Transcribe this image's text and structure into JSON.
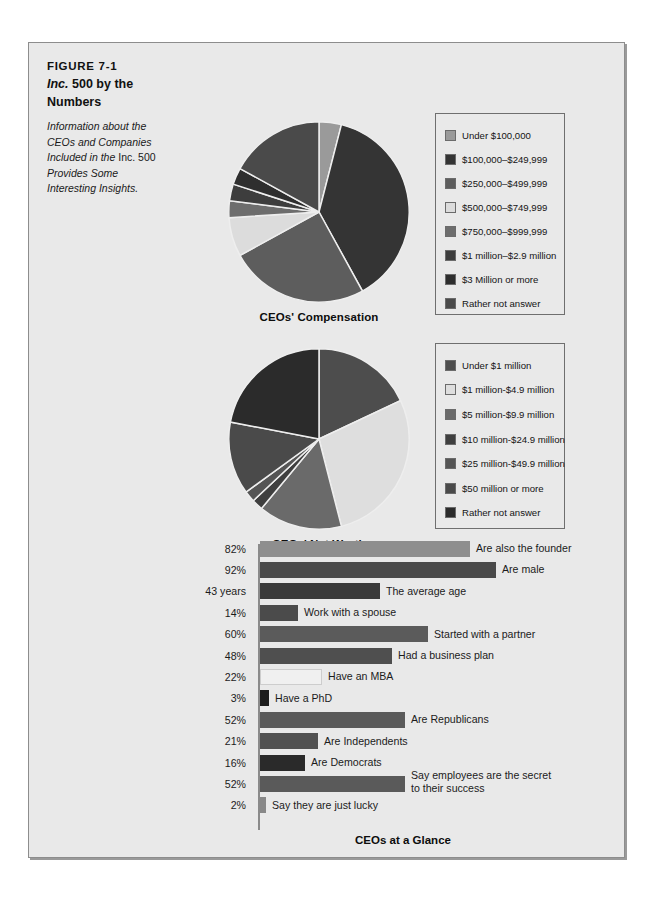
{
  "figure": {
    "number": "FIGURE 7-1",
    "title_italic": "Inc.",
    "title_rest": " 500 by the",
    "title_line2": "Numbers",
    "description_line1": "Information about the",
    "description_line2": "CEOs and Companies",
    "description_line3a": "Included in the ",
    "description_line3b": "Inc. 500",
    "description_line4": "Provides Some",
    "description_line5": "Interesting Insights."
  },
  "chart_data": [
    {
      "type": "pie",
      "title": "CEOs' Compensation",
      "legend_position": "right",
      "categories": [
        "Under $100,000",
        "$100,000–$249,999",
        "$250,000–$499,999",
        "$500,000–$749,999",
        "$750,000–$999,999",
        "$1 million–$2.9 million",
        "$3 Million or more",
        "Rather not answer"
      ],
      "values": [
        4,
        38,
        25,
        7,
        3,
        3,
        3,
        17
      ],
      "colors": [
        "#9a9a9a",
        "#343434",
        "#5d5d5d",
        "#dcdcdc",
        "#6d6d6d",
        "#3d3d3d",
        "#2e2e2e",
        "#4a4a4a"
      ]
    },
    {
      "type": "pie",
      "title": "CEOs' Net Worth",
      "legend_position": "right",
      "categories": [
        "Under $1 million",
        "$1 million-$4.9 million",
        "$5 million-$9.9 million",
        "$10 million-$24.9 million",
        "$25 million-$49.9 million",
        "$50 million or more",
        "Rather not answer"
      ],
      "values": [
        18,
        28,
        15,
        2,
        2,
        13,
        22
      ],
      "colors": [
        "#4d4d4d",
        "#dedede",
        "#6a6a6a",
        "#3f3f3f",
        "#555555",
        "#4a4a4a",
        "#2b2b2b"
      ]
    },
    {
      "type": "bar",
      "title": "CEOs at a Glance",
      "orientation": "horizontal",
      "xlabel": "",
      "ylabel": "",
      "categories": [
        "Are also the founder",
        "Are male",
        "The average age",
        "Work with a spouse",
        "Started with a partner",
        "Had a business plan",
        "Have an MBA",
        "Have a PhD",
        "Are Republicans",
        "Are Independents",
        "Are Democrats",
        "Say employees are the secret to their success",
        "Say they are just lucky"
      ],
      "value_labels": [
        "82%",
        "92%",
        "43 years",
        "14%",
        "60%",
        "48%",
        "22%",
        "3%",
        "52%",
        "21%",
        "16%",
        "52%",
        "2%"
      ],
      "values": [
        82,
        92,
        43,
        14,
        60,
        48,
        22,
        3,
        52,
        21,
        16,
        52,
        2
      ],
      "bar_colors": [
        "#8e8e8e",
        "#4a4a4a",
        "#3a3a3a",
        "#4b4b4b",
        "#5b5b5b",
        "#4f4f4f",
        "#f0f0f0",
        "#1d1d1d",
        "#5a5a5a",
        "#515151",
        "#2a2a2a",
        "#5a5a5a",
        "#888888"
      ],
      "bars": [
        {
          "value_label": "82%",
          "value": 82,
          "label": "Are also the founder",
          "label2": "",
          "color": "#8e8e8e",
          "width": 210
        },
        {
          "value_label": "92%",
          "value": 92,
          "label": "Are male",
          "label2": "",
          "color": "#4a4a4a",
          "width": 236
        },
        {
          "value_label": "43 years",
          "value": 43,
          "label": "The average age",
          "label2": "",
          "color": "#3a3a3a",
          "width": 120
        },
        {
          "value_label": "14%",
          "value": 14,
          "label": "Work with a spouse",
          "label2": "",
          "color": "#4b4b4b",
          "width": 38
        },
        {
          "value_label": "60%",
          "value": 60,
          "label": "Started with a partner",
          "label2": "",
          "color": "#5b5b5b",
          "width": 168
        },
        {
          "value_label": "48%",
          "value": 48,
          "label": "Had a business plan",
          "label2": "",
          "color": "#4f4f4f",
          "width": 132
        },
        {
          "value_label": "22%",
          "value": 22,
          "label": "Have an MBA",
          "label2": "",
          "color": "#f0f0f0",
          "width": 62
        },
        {
          "value_label": "3%",
          "value": 3,
          "label": "Have a PhD",
          "label2": "",
          "color": "#1d1d1d",
          "width": 9
        },
        {
          "value_label": "52%",
          "value": 52,
          "label": "Are Republicans",
          "label2": "",
          "color": "#5a5a5a",
          "width": 145
        },
        {
          "value_label": "21%",
          "value": 21,
          "label": "Are Independents",
          "label2": "",
          "color": "#515151",
          "width": 58
        },
        {
          "value_label": "16%",
          "value": 16,
          "label": "Are Democrats",
          "label2": "",
          "color": "#2a2a2a",
          "width": 45
        },
        {
          "value_label": "52%",
          "value": 52,
          "label": "Say employees are the secret",
          "label2": "to their success",
          "color": "#5a5a5a",
          "width": 145
        },
        {
          "value_label": "2%",
          "value": 2,
          "label": "Say they are just lucky",
          "label2": "",
          "color": "#888888",
          "width": 6
        }
      ]
    }
  ]
}
